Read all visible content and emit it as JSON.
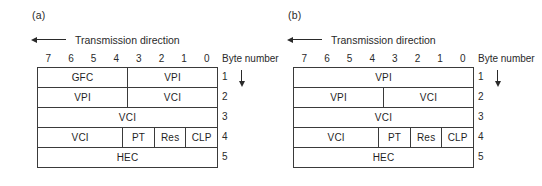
{
  "figure": {
    "panels": [
      {
        "label": "(a)",
        "transmission_label": "Transmission direction",
        "transmission_arrow_icon": "arrow-left-icon",
        "bit_numbers": [
          "7",
          "6",
          "5",
          "4",
          "3",
          "2",
          "1",
          "0"
        ],
        "byte_number_header": "Byte number",
        "byte_numbers": [
          "1",
          "2",
          "3",
          "4",
          "5"
        ],
        "flow_arrow_icon": "arrow-down-icon",
        "rows": [
          {
            "byte": "1",
            "fields": [
              {
                "label": "GFC",
                "width": 4
              },
              {
                "label": "VPI",
                "width": 4
              }
            ]
          },
          {
            "byte": "2",
            "fields": [
              {
                "label": "VPI",
                "width": 4
              },
              {
                "label": "VCI",
                "width": 4
              }
            ]
          },
          {
            "byte": "3",
            "fields": [
              {
                "label": "VCI",
                "width": 8
              }
            ]
          },
          {
            "byte": "4",
            "fields": [
              {
                "label": "VCI",
                "width": 4
              },
              {
                "label": "PT",
                "width": 1.45
              },
              {
                "label": "Res",
                "width": 1.45
              },
              {
                "label": "CLP",
                "width": 1.45
              }
            ]
          },
          {
            "byte": "5",
            "fields": [
              {
                "label": "HEC",
                "width": 8
              }
            ]
          }
        ]
      },
      {
        "label": "(b)",
        "transmission_label": "Transmission direction",
        "transmission_arrow_icon": "arrow-left-icon",
        "bit_numbers": [
          "7",
          "6",
          "5",
          "4",
          "3",
          "2",
          "1",
          "0"
        ],
        "byte_number_header": "Byte number",
        "byte_numbers": [
          "1",
          "2",
          "3",
          "4",
          "5"
        ],
        "flow_arrow_icon": "arrow-down-icon",
        "rows": [
          {
            "byte": "1",
            "fields": [
              {
                "label": "VPI",
                "width": 8
              }
            ]
          },
          {
            "byte": "2",
            "fields": [
              {
                "label": "VPI",
                "width": 4
              },
              {
                "label": "VCI",
                "width": 4
              }
            ]
          },
          {
            "byte": "3",
            "fields": [
              {
                "label": "VCI",
                "width": 8
              }
            ]
          },
          {
            "byte": "4",
            "fields": [
              {
                "label": "VCI",
                "width": 4
              },
              {
                "label": "PT",
                "width": 1.45
              },
              {
                "label": "Res",
                "width": 1.45
              },
              {
                "label": "CLP",
                "width": 1.45
              }
            ]
          },
          {
            "byte": "5",
            "fields": [
              {
                "label": "HEC",
                "width": 8
              }
            ]
          }
        ]
      }
    ],
    "colors": {
      "line": "#3a3a3a",
      "text": "#1f1f1f",
      "background": "#ffffff"
    }
  }
}
